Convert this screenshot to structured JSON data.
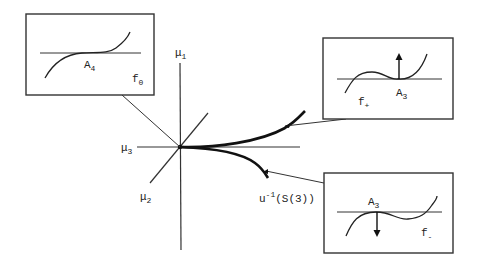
{
  "diagram": {
    "type": "bifurcation-set-diagram",
    "axes": [
      {
        "id": "mu1",
        "label": "μ",
        "subscript": "1",
        "direction": "vertical"
      },
      {
        "id": "mu2",
        "label": "μ",
        "subscript": "2",
        "direction": "diagonal"
      },
      {
        "id": "mu3",
        "label": "μ",
        "subscript": "3",
        "direction": "horizontal"
      }
    ],
    "curve": {
      "label_main": "u",
      "label_sup": "-1",
      "label_rest": "(S(3))",
      "description": "cusp-shaped curve with two branches emanating from origin"
    },
    "insets": [
      {
        "id": "f0",
        "function_label": "f",
        "function_subscript": "0",
        "singularity_label": "A",
        "singularity_subscript": "4",
        "points_to": "origin",
        "arrow": "none"
      },
      {
        "id": "fplus",
        "function_label": "f",
        "function_subscript": "+",
        "singularity_label": "A",
        "singularity_subscript": "3",
        "points_to": "upper-branch",
        "arrow": "up"
      },
      {
        "id": "fminus",
        "function_label": "f",
        "function_subscript": "-",
        "singularity_label": "A",
        "singularity_subscript": "3",
        "points_to": "lower-branch",
        "arrow": "down"
      }
    ]
  }
}
